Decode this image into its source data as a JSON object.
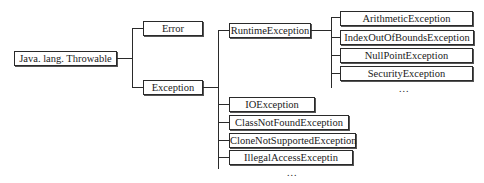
{
  "diagram": {
    "type": "class-hierarchy-tree",
    "root": {
      "label": "Java. lang. Throwable"
    },
    "level1": [
      {
        "label": "Error"
      },
      {
        "label": "Exception"
      }
    ],
    "exception_children": {
      "runtime": {
        "label": "RuntimeException"
      },
      "checked": [
        {
          "label": "IOException"
        },
        {
          "label": "ClassNotFoundException"
        },
        {
          "label": "CloneNotSupportedException"
        },
        {
          "label": "IllegalAccessExceptin"
        }
      ],
      "checked_more": "..."
    },
    "runtime_children": [
      {
        "label": "ArithmeticException"
      },
      {
        "label": "IndexOutOfBoundsException"
      },
      {
        "label": "NullPointException"
      },
      {
        "label": "SecurityException"
      }
    ],
    "runtime_more": "..."
  }
}
